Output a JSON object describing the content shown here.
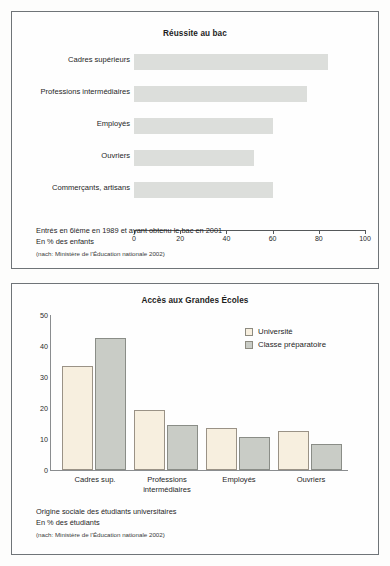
{
  "charts": [
    {
      "title": "Réussite au bac",
      "caption_line1": "Entrés en 6ième en 1989 et ayant obtenu le bac en 2001",
      "caption_line2": "En % des enfants",
      "source": "(nach: Ministère de l'Éducation nationale 2002)"
    },
    {
      "title": "Accès aux Grandes Écoles",
      "caption_line1": "Origine sociale des étudiants universitaires",
      "caption_line2": "En % des étudiants",
      "source": "(nach: Ministère de l'Éducation nationale 2002)"
    }
  ],
  "chart_data": [
    {
      "type": "bar",
      "orientation": "horizontal",
      "title": "Réussite au bac",
      "xlabel": "",
      "ylabel": "",
      "xlim": [
        0,
        100
      ],
      "xticks": [
        0,
        20,
        40,
        60,
        80,
        100
      ],
      "xtick_labels": [
        "0",
        "20",
        "40",
        "60",
        "80",
        "100"
      ],
      "grid": false,
      "legend": "none",
      "bar_color": "#dcdedb",
      "categories": [
        "Cadres supérieurs",
        "Professions intermédiaires",
        "Employés",
        "Ouvriers",
        "Commerçants, artisans"
      ],
      "values": [
        84,
        75,
        60,
        52,
        60
      ],
      "annotations": [
        "Entrés en 6ième en 1989 et ayant obtenu le bac en 2001",
        "En % des enfants",
        "(nach: Ministère de l'Éducation nationale 2002)"
      ]
    },
    {
      "type": "bar",
      "orientation": "vertical",
      "title": "Accès aux Grandes Écoles",
      "xlabel": "",
      "ylabel": "",
      "ylim": [
        0,
        50
      ],
      "yticks": [
        0,
        10,
        20,
        30,
        40,
        50
      ],
      "ytick_labels": [
        "0",
        "10",
        "20",
        "30",
        "40",
        "50"
      ],
      "grid": false,
      "legend": "top-right",
      "categories": [
        "Cadres sup.",
        "Professions intermédiaires",
        "Employés",
        "Ouvriers"
      ],
      "series": [
        {
          "name": "Université",
          "color": "#f7efdf",
          "values": [
            33.5,
            19.5,
            13.5,
            12.5
          ]
        },
        {
          "name": "Classe préparatoire",
          "color": "#c9ccc6",
          "values": [
            42.5,
            14.5,
            10.5,
            8.5
          ]
        }
      ],
      "annotations": [
        "Origine sociale des étudiants universitaires",
        "En % des étudiants",
        "(nach: Ministère de l'Éducation nationale 2002)"
      ]
    }
  ],
  "top_chart": {
    "title": "Réussite au bac",
    "bars": [
      {
        "label": "Cadres supérieurs",
        "value": 84
      },
      {
        "label": "Professions intermédiaires",
        "value": 75
      },
      {
        "label": "Employés",
        "value": 60
      },
      {
        "label": "Ouvriers",
        "value": 52
      },
      {
        "label": "Commerçants, artisans",
        "value": 60
      }
    ],
    "ticks": [
      "0",
      "20",
      "40",
      "60",
      "80",
      "100"
    ],
    "caption_line1": "Entrés en 6ième en 1989 et ayant obtenu le bac en 2001",
    "caption_line2": "En % des enfants",
    "source": "(nach: Ministère de l'Éducation nationale 2002)"
  },
  "bottom_chart": {
    "title": "Accès aux Grandes Écoles",
    "yticks": [
      "50",
      "40",
      "30",
      "20",
      "10",
      "0"
    ],
    "legend": [
      {
        "label": "Université",
        "color": "#f7efdf"
      },
      {
        "label": "Classe préparatoire",
        "color": "#c9ccc6"
      }
    ],
    "groups": [
      {
        "label_line1": "Cadres sup.",
        "label_line2": "",
        "uni": 33.5,
        "prep": 42.5
      },
      {
        "label_line1": "Professions",
        "label_line2": "intermédiaires",
        "uni": 19.5,
        "prep": 14.5
      },
      {
        "label_line1": "Employés",
        "label_line2": "",
        "uni": 13.5,
        "prep": 10.5
      },
      {
        "label_line1": "Ouvriers",
        "label_line2": "",
        "uni": 12.5,
        "prep": 8.5
      }
    ],
    "caption_line1": "Origine sociale des étudiants universitaires",
    "caption_line2": "En % des étudiants",
    "source": "(nach: Ministère de l'Éducation nationale 2002)"
  }
}
